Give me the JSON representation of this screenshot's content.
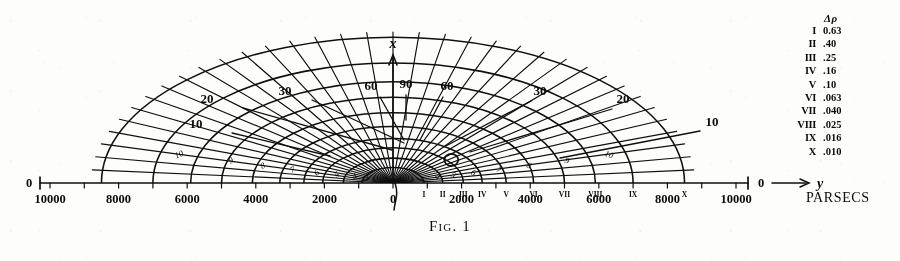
{
  "figure": {
    "caption": "Fig. 1",
    "axis_unit_label": "PARSECS",
    "x_axis_label": "x",
    "y_axis_label": "y",
    "origin_label": "0",
    "left_end_label": "0",
    "right_end_label": "0"
  },
  "axis": {
    "tick_labels_left": [
      "10000",
      "8000",
      "6000",
      "4000",
      "2000"
    ],
    "center_label": "0",
    "tick_labels_right": [
      "2000",
      "4000",
      "6000",
      "8000",
      "10000"
    ],
    "max_parsecs": 10000,
    "minor_tick_step": 1000
  },
  "legend": {
    "header": "Δρ",
    "rows": [
      {
        "roman": "I",
        "value": "0.63"
      },
      {
        "roman": "II",
        "value": ".40"
      },
      {
        "roman": "III",
        "value": ".25"
      },
      {
        "roman": "IV",
        "value": ".16"
      },
      {
        "roman": "V",
        "value": ".10"
      },
      {
        "roman": "VI",
        "value": ".063"
      },
      {
        "roman": "VII",
        "value": ".040"
      },
      {
        "roman": "VIII",
        "value": ".025"
      },
      {
        "roman": "IX",
        "value": ".016"
      },
      {
        "roman": "X",
        "value": ".010"
      }
    ]
  },
  "chart_data": {
    "type": "line",
    "title": "Fig. 1",
    "xlabel": "y (PARSECS)",
    "ylabel": "x (PARSECS)",
    "xlim": [
      -10000,
      10000
    ],
    "ylim": [
      0,
      7000
    ],
    "grid": true,
    "legend_position": "right",
    "radial_angle_labels": [
      {
        "label": "10",
        "side": "left",
        "angle_deg": 10
      },
      {
        "label": "20",
        "side": "left",
        "angle_deg": 20
      },
      {
        "label": "30",
        "side": "left",
        "angle_deg": 30
      },
      {
        "label": "60",
        "side": "left",
        "angle_deg": 60
      },
      {
        "label": "90",
        "side": "center",
        "angle_deg": 90
      },
      {
        "label": "60",
        "side": "right",
        "angle_deg": 60
      },
      {
        "label": "30",
        "side": "right",
        "angle_deg": 30
      },
      {
        "label": "20",
        "side": "right",
        "angle_deg": 20
      },
      {
        "label": "10",
        "side": "right",
        "angle_deg": 10
      }
    ],
    "arc_inline_labels": [
      "10",
      "9",
      "8",
      "7",
      "6",
      "5",
      "4",
      "3",
      "2",
      "1"
    ],
    "axis_roman_markers": [
      "I",
      "II",
      "III",
      "IV",
      "V",
      "VI",
      "VII",
      "VIII",
      "IX",
      "X"
    ],
    "contours": [
      {
        "roman": "I",
        "delta_rho": 0.63,
        "radius_parsecs": 900
      },
      {
        "roman": "II",
        "delta_rho": 0.4,
        "radius_parsecs": 1450
      },
      {
        "roman": "III",
        "delta_rho": 0.25,
        "radius_parsecs": 2050
      },
      {
        "roman": "IV",
        "delta_rho": 0.16,
        "radius_parsecs": 2600
      },
      {
        "roman": "V",
        "delta_rho": 0.1,
        "radius_parsecs": 3300
      },
      {
        "roman": "VI",
        "delta_rho": 0.063,
        "radius_parsecs": 4100
      },
      {
        "roman": "VII",
        "delta_rho": 0.04,
        "radius_parsecs": 5000
      },
      {
        "roman": "VIII",
        "delta_rho": 0.025,
        "radius_parsecs": 5900
      },
      {
        "roman": "IX",
        "delta_rho": 0.016,
        "radius_parsecs": 7000
      },
      {
        "roman": "X",
        "delta_rho": 0.01,
        "radius_parsecs": 8500
      }
    ],
    "sun_marker": {
      "label": "",
      "y_parsecs": 1700,
      "x_parsecs": 300
    }
  }
}
